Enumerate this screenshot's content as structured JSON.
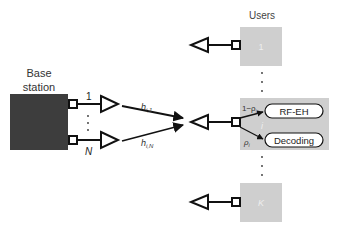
{
  "users_header": "Users",
  "base_station": {
    "line1": "Base",
    "line2": "station",
    "color": "#3d3d3d"
  },
  "bs_antennas": {
    "first": "1",
    "last": "N"
  },
  "channels": {
    "first": "h",
    "first_sub": "i,1",
    "last": "h",
    "last_sub": "i,N"
  },
  "users": [
    {
      "label": "1",
      "color": "#cfcfcf"
    },
    {
      "label": "i",
      "color": "#cfcfcf"
    },
    {
      "label": "K",
      "color": "#cfcfcf"
    }
  ],
  "splitter": {
    "upper_ratio": "1−ρ",
    "upper_sub": "i",
    "lower_ratio": "ρ",
    "lower_sub": "i",
    "rf_eh": "RF-EH",
    "decoding": "Decoding"
  },
  "ellipsis": "⋮"
}
